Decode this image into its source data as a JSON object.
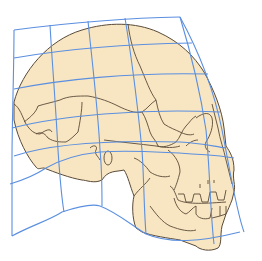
{
  "figure": {
    "title": "Human skull in lateral view on a deformed Cartesian coordinate grid",
    "subject": "skull",
    "view": "lateral (left-facing profile, face on right)"
  },
  "colors": {
    "background": "#ffffff",
    "bone_fill": "#f8e6c2",
    "outline": "#5a4a38",
    "grid": "#5b8fe0"
  },
  "grid": {
    "rows": 7,
    "columns": 5,
    "style": "curvilinear transformed grid"
  }
}
